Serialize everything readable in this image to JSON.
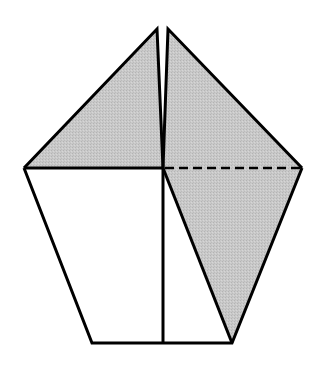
{
  "diagram": {
    "type": "origami-fold-step",
    "width": 326,
    "height": 369,
    "colors": {
      "background": "#ffffff",
      "shade": "#c6c6c6",
      "stroke": "#000000"
    },
    "stroke_width": 3,
    "dash_pattern": "9,5",
    "points": {
      "left_tip": [
        157,
        29
      ],
      "right_tip": [
        168,
        29
      ],
      "left_corner": [
        24,
        168
      ],
      "right_corner": [
        302,
        168
      ],
      "center": [
        163,
        168
      ],
      "bottom_left": [
        92,
        343
      ],
      "bottom_center": [
        163,
        343
      ],
      "bottom_right": [
        232,
        343
      ]
    },
    "regions": [
      {
        "name": "upper-left-flap",
        "shaded": true,
        "points": [
          [
            24,
            168
          ],
          [
            157,
            29
          ],
          [
            163,
            168
          ]
        ]
      },
      {
        "name": "upper-right-flap",
        "shaded": true,
        "points": [
          [
            168,
            29
          ],
          [
            302,
            168
          ],
          [
            163,
            168
          ]
        ]
      },
      {
        "name": "lower-left-panel",
        "shaded": false,
        "points": [
          [
            24,
            168
          ],
          [
            163,
            168
          ],
          [
            163,
            343
          ],
          [
            92,
            343
          ]
        ]
      },
      {
        "name": "lower-right-white",
        "shaded": false,
        "points": [
          [
            163,
            168
          ],
          [
            232,
            343
          ],
          [
            163,
            343
          ]
        ]
      },
      {
        "name": "lower-right-flap",
        "shaded": true,
        "points": [
          [
            163,
            168
          ],
          [
            302,
            168
          ],
          [
            232,
            343
          ]
        ]
      }
    ],
    "lines": [
      {
        "name": "valley-fold-line",
        "style": "dashed",
        "from": [
          163,
          168
        ],
        "to": [
          302,
          168
        ]
      },
      {
        "name": "horizontal-crease-left",
        "style": "solid",
        "from": [
          24,
          168
        ],
        "to": [
          163,
          168
        ]
      },
      {
        "name": "center-vertical-line",
        "style": "solid",
        "from": [
          163,
          168
        ],
        "to": [
          163,
          343
        ]
      },
      {
        "name": "diagonal-edge",
        "style": "solid",
        "from": [
          163,
          168
        ],
        "to": [
          232,
          343
        ]
      }
    ]
  }
}
